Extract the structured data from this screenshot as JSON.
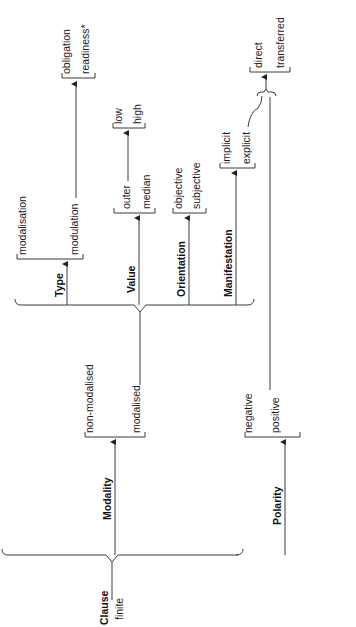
{
  "diagram": {
    "type": "system-network",
    "orientation": "rotated-90-ccw",
    "entry": {
      "line1": "Clause",
      "line2": "finite"
    },
    "systems": {
      "modality": {
        "label": "Modality",
        "options": [
          "non-modalised",
          "modalised"
        ],
        "subsystems": {
          "type": {
            "label": "Type",
            "options": [
              "modalisation",
              "modulation"
            ],
            "modulation_options": [
              "obligation",
              "readiness*"
            ]
          },
          "value": {
            "label": "Value",
            "options": [
              "outer",
              "median"
            ],
            "outer_options": [
              "low",
              "high"
            ]
          },
          "orientation": {
            "label": "Orientation",
            "options": [
              "objective",
              "subjective"
            ]
          },
          "manifestation": {
            "label": "Manifestation",
            "options": [
              "implicit",
              "explicit"
            ]
          }
        }
      },
      "polarity": {
        "label": "Polarity",
        "options": [
          "negative",
          "positive"
        ]
      },
      "explicit_negative": {
        "entry_conditions": [
          "explicit",
          "negative"
        ],
        "options": [
          "direct",
          "transferred"
        ]
      }
    }
  }
}
